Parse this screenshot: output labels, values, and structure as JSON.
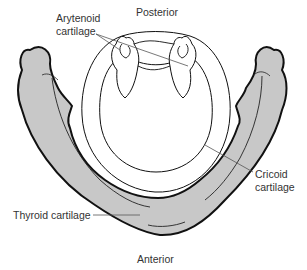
{
  "diagram": {
    "labels": {
      "posterior": "Posterior",
      "anterior": "Anterior",
      "arytenoid_line1": "Arytenoid",
      "arytenoid_line2": "cartilage",
      "cricoid_line1": "Cricoid",
      "cricoid_line2": "cartilage",
      "thyroid": "Thyroid cartilage"
    },
    "colors": {
      "cartilage_fill": "#c8c8c8",
      "outline": "#111111",
      "background": "#ffffff",
      "label_text": "#333333",
      "leader_line": "#555555"
    }
  }
}
